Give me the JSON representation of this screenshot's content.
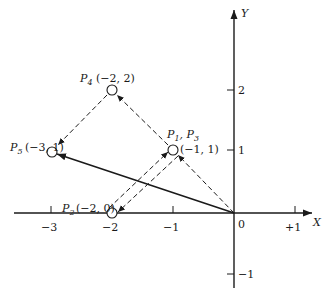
{
  "diagram": {
    "axes": {
      "x_label": "X",
      "y_label": "Y",
      "origin_label": "0",
      "x_ticks": [
        "−3",
        "−2",
        "−1",
        "+1"
      ],
      "y_ticks": [
        "2",
        "1",
        "−1"
      ]
    },
    "points": [
      {
        "name": "P",
        "sub": "4",
        "coords": "(−2, 2)"
      },
      {
        "name": "P",
        "sub": "5",
        "coords": "(−3, 1)"
      },
      {
        "name": "P",
        "sub": "1",
        "name2": "P",
        "sub2": "3",
        "coords": "(−1, 1)"
      },
      {
        "name": "P",
        "sub": "2",
        "coords": "(−2, 0)"
      }
    ],
    "colors": {
      "ink": "#1a1a1a",
      "background": "#ffffff"
    }
  }
}
